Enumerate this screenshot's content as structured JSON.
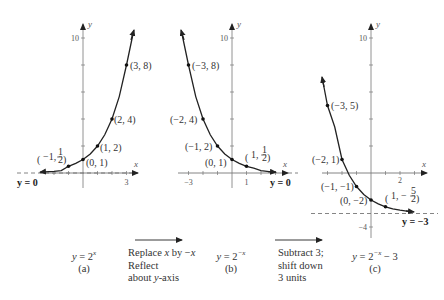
{
  "graphs": [
    {
      "id": "a",
      "equation": "y = 2^x",
      "equation_html_base": "y = 2",
      "equation_exp": "x",
      "label": "(a)",
      "y_tick_top": "10",
      "x_tick": "3",
      "asymptote_label": "y = 0",
      "points": [
        {
          "x": -1,
          "y": 0.5,
          "label": "(−1, ½)"
        },
        {
          "x": 0,
          "y": 1,
          "label": "(0, 1)"
        },
        {
          "x": 1,
          "y": 2,
          "label": "(1, 2)"
        },
        {
          "x": 2,
          "y": 4,
          "label": "(2, 4)"
        },
        {
          "x": 3,
          "y": 8,
          "label": "(3, 8)"
        }
      ]
    },
    {
      "id": "b",
      "equation": "y = 2^−x",
      "equation_html_base": "y = 2",
      "equation_exp": "−x",
      "label": "(b)",
      "y_tick_top": "10",
      "x_tick_left": "−3",
      "x_tick_right": "1",
      "asymptote_label": "y = 0",
      "points": [
        {
          "x": -3,
          "y": 8,
          "label": "(−3, 8)"
        },
        {
          "x": -2,
          "y": 4,
          "label": "(−2, 4)"
        },
        {
          "x": -1,
          "y": 2,
          "label": "(−1, 2)"
        },
        {
          "x": 0,
          "y": 1,
          "label": "(0, 1)"
        },
        {
          "x": 1,
          "y": 0.5,
          "label": "(1, ½)"
        }
      ]
    },
    {
      "id": "c",
      "equation": "y = 2^−x − 3",
      "equation_html_base": "y = 2",
      "equation_exp": "−x",
      "equation_tail": " − 3",
      "label": "(c)",
      "y_tick_top": "10",
      "y_tick_bottom": "−4",
      "x_tick": "2",
      "asymptote_label": "y = −3",
      "points": [
        {
          "x": -3,
          "y": 5,
          "label": "(−3, 5)"
        },
        {
          "x": -2,
          "y": 1,
          "label": "(−2, 1)"
        },
        {
          "x": -1,
          "y": -1,
          "label": "(−1, −1)"
        },
        {
          "x": 0,
          "y": -2,
          "label": "(0, −2)"
        },
        {
          "x": 1,
          "y": -2.5,
          "label": "(1, −5/2)"
        }
      ]
    }
  ],
  "axis_names": {
    "x": "x",
    "y": "y"
  },
  "transformations": [
    {
      "line1_pre": "Replace ",
      "line1_var": "x",
      "line1_mid": " by −",
      "line1_var2": "x",
      "line2": "Reflect",
      "line3_pre": "about ",
      "line3_var": "y",
      "line3_post": "-axis"
    },
    {
      "line1": "Subtract 3;",
      "line2": "shift down",
      "line3": "3 units"
    }
  ],
  "labels": {
    "a_p_m1": "−1,",
    "a_p_0": "(0, 1)",
    "a_p_1": "(1, 2)",
    "a_p_2": "(2, 4)",
    "a_p_3": "(3, 8)",
    "b_p_m3": "(−3, 8)",
    "b_p_m2": "(−2, 4)",
    "b_p_m1": "(−1, 2)",
    "b_p_0": "(0, 1)",
    "b_p_1": "1,",
    "c_p_m3": "(−3, 5)",
    "c_p_m2": "(−2, 1)",
    "c_p_m1": "(−1, −1)",
    "c_p_0": "(0, −2)",
    "c_p_1": "1, −",
    "half_num": "1",
    "half_den": "2",
    "five": "5"
  }
}
